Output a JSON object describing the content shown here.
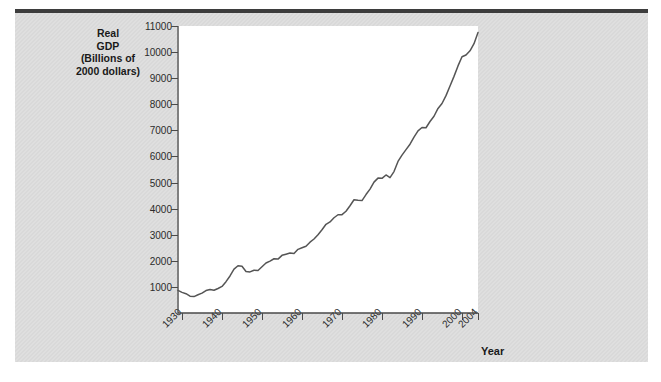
{
  "figure": {
    "ylabel_lines": [
      "Real",
      "GDP",
      "(Billions of",
      "2000 dollars)"
    ],
    "xlabel": "Year"
  },
  "colors": {
    "panel": "#d9d9d9",
    "plot_background": "#ffffff",
    "line": "#555555",
    "axis": "#4a4a4a",
    "top_rule": "#3d3d3d",
    "text": "#1a1a1a"
  },
  "chart_data": {
    "type": "line",
    "title": "",
    "xlabel": "Year",
    "ylabel": "Real GDP (Billions of 2000 dollars)",
    "xlim": [
      1929,
      2004
    ],
    "ylim": [
      0,
      11000
    ],
    "ytick_labels": [
      "1000",
      "2000",
      "3000",
      "4000",
      "5000",
      "6000",
      "7000",
      "8000",
      "9000",
      "10000",
      "11000"
    ],
    "yticks": [
      1000,
      2000,
      3000,
      4000,
      5000,
      6000,
      7000,
      8000,
      9000,
      10000,
      11000
    ],
    "xtick_labels": [
      "1930",
      "1940",
      "1950",
      "1960",
      "1970",
      "1980",
      "1990",
      "2000",
      "2004"
    ],
    "xticks": [
      1930,
      1940,
      1950,
      1960,
      1970,
      1980,
      1990,
      2000,
      2004
    ],
    "grid": false,
    "legend": "none",
    "series": [
      {
        "name": "Real GDP",
        "x": [
          1929,
          1930,
          1931,
          1932,
          1933,
          1934,
          1935,
          1936,
          1937,
          1938,
          1939,
          1940,
          1941,
          1942,
          1943,
          1944,
          1945,
          1946,
          1947,
          1948,
          1949,
          1950,
          1951,
          1952,
          1953,
          1954,
          1955,
          1956,
          1957,
          1958,
          1959,
          1960,
          1961,
          1962,
          1963,
          1964,
          1965,
          1966,
          1967,
          1968,
          1969,
          1970,
          1971,
          1972,
          1973,
          1974,
          1975,
          1976,
          1977,
          1978,
          1979,
          1980,
          1981,
          1982,
          1983,
          1984,
          1985,
          1986,
          1987,
          1988,
          1989,
          1990,
          1991,
          1992,
          1993,
          1994,
          1995,
          1996,
          1997,
          1998,
          1999,
          2000,
          2001,
          2002,
          2003,
          2004
        ],
        "values": [
          865,
          790,
          740,
          645,
          630,
          700,
          760,
          860,
          900,
          870,
          940,
          1020,
          1200,
          1420,
          1680,
          1810,
          1790,
          1590,
          1575,
          1640,
          1630,
          1775,
          1915,
          1990,
          2080,
          2065,
          2210,
          2255,
          2300,
          2280,
          2440,
          2500,
          2560,
          2715,
          2835,
          3000,
          3190,
          3400,
          3490,
          3650,
          3765,
          3770,
          3900,
          4110,
          4340,
          4320,
          4310,
          4540,
          4750,
          5015,
          5170,
          5160,
          5290,
          5190,
          5420,
          5810,
          6050,
          6260,
          6470,
          6740,
          6980,
          7110,
          7100,
          7340,
          7540,
          7840,
          8030,
          8330,
          8700,
          9070,
          9470,
          9820,
          9890,
          10050,
          10320,
          10750
        ]
      }
    ]
  }
}
